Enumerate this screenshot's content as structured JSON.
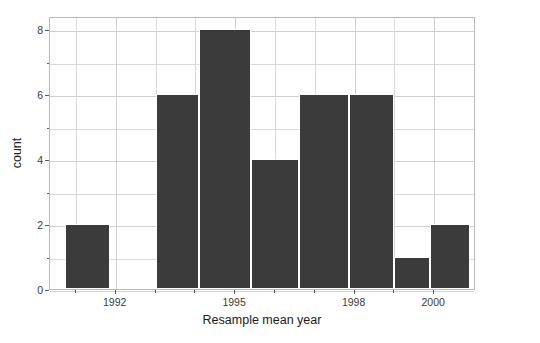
{
  "chart_data": {
    "type": "bar",
    "title": "",
    "subtitle": "",
    "xlabel": "Resample mean year",
    "ylabel": "count",
    "xlim": [
      1990.35,
      1001.05
    ],
    "ylim": [
      0,
      8.4
    ],
    "grid": true,
    "legend": null,
    "bar_color": "#3b3b3b",
    "bar_edge_color": "#ffffff",
    "panel_background": "#ffffff",
    "grid_color": "#d9d9d9",
    "x_ticks": [
      {
        "value": 1992,
        "label": "1992"
      },
      {
        "value": 1995,
        "label": "1995"
      },
      {
        "value": 1998,
        "label": "1998"
      },
      {
        "value": 2000,
        "label": "2000"
      }
    ],
    "x_minor_ticks": [
      1991,
      1993,
      1994,
      1996,
      1997,
      1999
    ],
    "y_ticks": [
      {
        "value": 0,
        "label": "0"
      },
      {
        "value": 2,
        "label": "2"
      },
      {
        "value": 4,
        "label": "4"
      },
      {
        "value": 6,
        "label": "6"
      },
      {
        "value": 8,
        "label": "8"
      }
    ],
    "y_minor_ticks": [
      1,
      3,
      5,
      7
    ],
    "bins": [
      {
        "left": 1990.72,
        "right": 1991.85,
        "count": 2
      },
      {
        "left": 1993.0,
        "right": 1994.1,
        "count": 6
      },
      {
        "left": 1994.1,
        "right": 1995.4,
        "count": 8
      },
      {
        "left": 1995.4,
        "right": 1996.6,
        "count": 4
      },
      {
        "left": 1996.6,
        "right": 1997.85,
        "count": 6
      },
      {
        "left": 1997.85,
        "right": 1999.0,
        "count": 6
      },
      {
        "left": 1999.0,
        "right": 1999.9,
        "count": 1
      },
      {
        "left": 1999.9,
        "right": 2000.9,
        "count": 2
      }
    ],
    "categories": [
      "1990.7-1991.9",
      "1993.0-1994.1",
      "1994.1-1995.4",
      "1995.4-1996.6",
      "1996.6-1997.9",
      "1997.9-1999.0",
      "1999.0-1999.9",
      "1999.9-2000.9"
    ],
    "values": [
      2,
      6,
      8,
      4,
      6,
      6,
      1,
      2
    ]
  }
}
